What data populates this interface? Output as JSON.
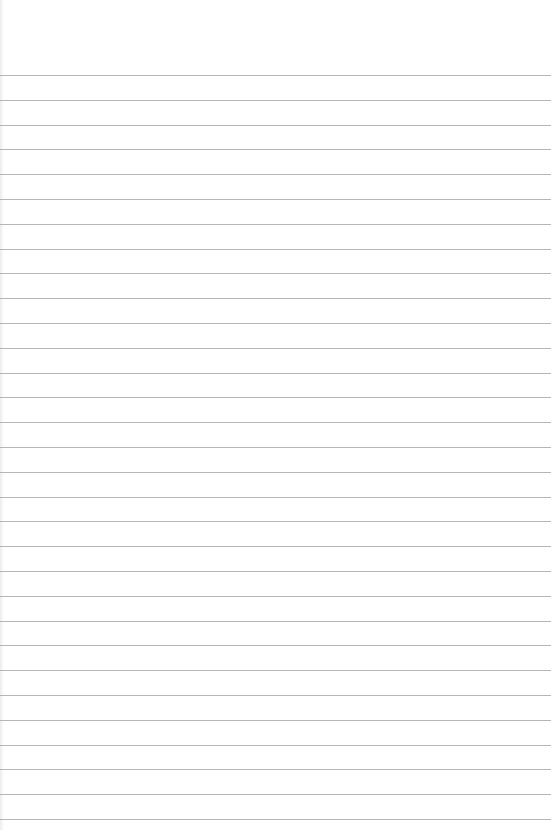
{
  "paper": {
    "type": "lined-paper",
    "background_color": "#ffffff",
    "line_color": "#a9a9a9",
    "line_count": 31,
    "first_line_y": 75,
    "line_spacing": 24.8
  }
}
